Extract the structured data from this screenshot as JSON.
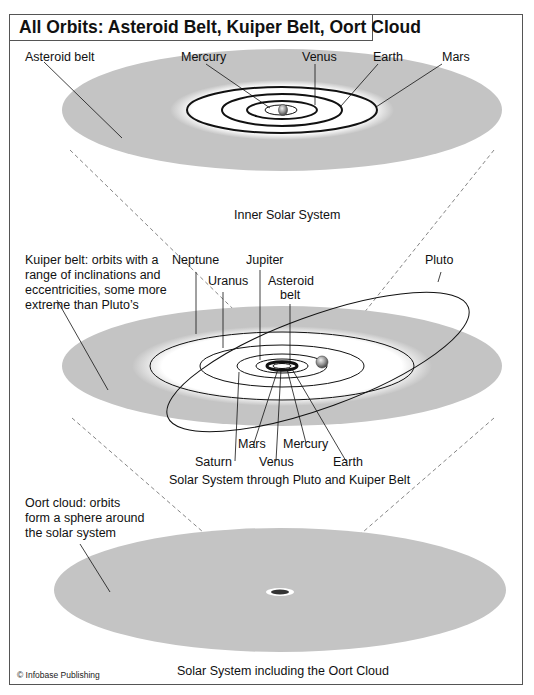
{
  "title": "All Orbits: Asteroid Belt, Kuiper Belt, Oort Cloud",
  "panels": {
    "inner": {
      "caption": "Inner Solar System",
      "labels": {
        "asteroid_belt": "Asteroid belt",
        "mercury": "Mercury",
        "venus": "Venus",
        "earth": "Earth",
        "mars": "Mars"
      }
    },
    "kuiper": {
      "caption": "Solar System through Pluto and Kuiper Belt",
      "description": [
        "Kuiper belt: orbits with a",
        "range of inclinations and",
        "eccentricities, some more",
        "extreme than Pluto’s"
      ],
      "labels": {
        "neptune": "Neptune",
        "jupiter": "Jupiter",
        "uranus": "Uranus",
        "asteroid_belt_1": "Asteroid",
        "asteroid_belt_2": "belt",
        "pluto": "Pluto",
        "saturn": "Saturn",
        "mars": "Mars",
        "venus": "Venus",
        "mercury": "Mercury",
        "earth": "Earth"
      }
    },
    "oort": {
      "caption": "Solar System including the Oort Cloud",
      "description": [
        "Oort cloud: orbits",
        "form a sphere around",
        "the solar system"
      ]
    }
  },
  "copyright": "© Infobase Publishing",
  "colors": {
    "belt_gray": "#c4c4c4",
    "line": "#111111",
    "frame": "#555555"
  }
}
